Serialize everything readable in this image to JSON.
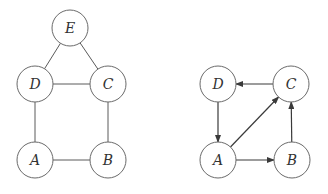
{
  "graphs": {
    "undirected": {
      "nodes": [
        {
          "id": "E",
          "label": "E",
          "x": 70,
          "y": 28
        },
        {
          "id": "D",
          "label": "D",
          "x": 35,
          "y": 84
        },
        {
          "id": "C",
          "label": "C",
          "x": 108,
          "y": 84
        },
        {
          "id": "A",
          "label": "A",
          "x": 35,
          "y": 160
        },
        {
          "id": "B",
          "label": "B",
          "x": 108,
          "y": 160
        }
      ],
      "edges": [
        [
          "E",
          "D"
        ],
        [
          "E",
          "C"
        ],
        [
          "D",
          "C"
        ],
        [
          "D",
          "A"
        ],
        [
          "C",
          "B"
        ],
        [
          "A",
          "B"
        ]
      ]
    },
    "directed": {
      "nodes": [
        {
          "id": "D",
          "label": "D",
          "x": 218,
          "y": 84
        },
        {
          "id": "C",
          "label": "C",
          "x": 291,
          "y": 84
        },
        {
          "id": "A",
          "label": "A",
          "x": 218,
          "y": 160
        },
        {
          "id": "B",
          "label": "B",
          "x": 292,
          "y": 160
        }
      ],
      "edges": [
        [
          "C",
          "D"
        ],
        [
          "D",
          "A"
        ],
        [
          "A",
          "C"
        ],
        [
          "A",
          "B"
        ],
        [
          "B",
          "C"
        ]
      ]
    }
  },
  "node_radius": 18,
  "colors": {
    "stroke": "#6a6a6a",
    "arrow": "#3a3a3a",
    "text": "#333333"
  }
}
